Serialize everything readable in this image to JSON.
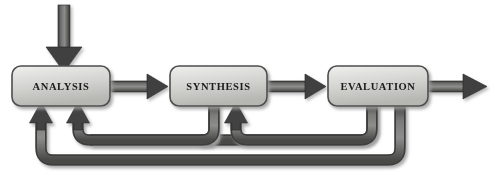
{
  "diagram": {
    "type": "process-flow-with-feedback-loops",
    "background_color": "#ffffff",
    "stages": [
      {
        "id": "analysis",
        "label": "ANALYSIS",
        "x": 12,
        "y": 66,
        "width": 98,
        "height": 40
      },
      {
        "id": "synthesis",
        "label": "SYNTHESIS",
        "x": 170,
        "y": 66,
        "width": 97,
        "height": 40
      },
      {
        "id": "evaluation",
        "label": "EVALUATION",
        "x": 328,
        "y": 66,
        "width": 100,
        "height": 40
      }
    ],
    "forward_arrows": [
      {
        "id": "input-arrow",
        "from": "external-input",
        "to": "analysis",
        "direction": "down"
      },
      {
        "id": "analysis-to-synthesis",
        "from": "analysis",
        "to": "synthesis",
        "direction": "right"
      },
      {
        "id": "synthesis-to-evaluation",
        "from": "synthesis",
        "to": "evaluation",
        "direction": "right"
      },
      {
        "id": "evaluation-output",
        "from": "evaluation",
        "to": "external-output",
        "direction": "right"
      }
    ],
    "feedback_loops": [
      {
        "id": "feedback-synthesis-to-analysis",
        "from": "synthesis",
        "to": "analysis",
        "depth": "inner"
      },
      {
        "id": "feedback-evaluation-to-synthesis",
        "from": "evaluation",
        "to": "synthesis",
        "depth": "middle"
      },
      {
        "id": "feedback-evaluation-to-analysis",
        "from": "evaluation",
        "to": "analysis",
        "depth": "outer"
      }
    ],
    "colors": {
      "box_fill_light": "#e8e8e6",
      "box_fill_dark": "#b9b9b6",
      "box_border": "#555555",
      "arrow_fill_light": "#8e8e8c",
      "arrow_fill_dark": "#4a4a4a",
      "text": "#1a1a1a",
      "shadow": "#c9c9c9"
    }
  }
}
